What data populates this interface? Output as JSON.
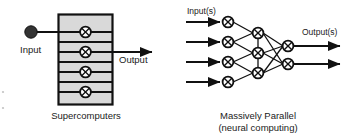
{
  "figure": {
    "width": 357,
    "height": 139,
    "background": "#ffffff",
    "stroke": "#111111",
    "box_fill": "#d9d9d9",
    "node_fill": "#ffffff"
  },
  "left_panel": {
    "caption": "Supercomputers",
    "input_label": "Input",
    "output_label": "Output",
    "input_dot_icon": "filled-circle",
    "node_icon": "crossed-circle",
    "processor_count": 4,
    "band_count": 4
  },
  "right_panel": {
    "caption_line1": "Massively Parallel",
    "caption_line2": "(neural computing)",
    "input_label": "Input(s)",
    "output_label": "Output(s)",
    "node_icon": "crossed-circle",
    "input_node_count": 4,
    "hidden_node_count": 3,
    "output_node_count": 2,
    "input_arrow_count": 4,
    "output_arrow_count": 2
  }
}
